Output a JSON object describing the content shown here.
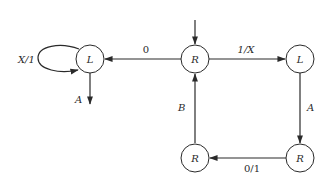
{
  "diagram": {
    "type": "state-machine",
    "nodes": [
      {
        "id": "n_left",
        "label": "L",
        "cx": 90,
        "cy": 59
      },
      {
        "id": "n_center",
        "label": "R",
        "cx": 195,
        "cy": 59
      },
      {
        "id": "n_right",
        "label": "L",
        "cx": 300,
        "cy": 59
      },
      {
        "id": "n_br",
        "label": "R",
        "cx": 300,
        "cy": 158
      },
      {
        "id": "n_bl",
        "label": "R",
        "cx": 195,
        "cy": 158
      }
    ],
    "edges": [
      {
        "from": "start",
        "to": "n_center",
        "label": ""
      },
      {
        "from": "n_center",
        "to": "n_left",
        "label": "0"
      },
      {
        "from": "n_center",
        "to": "n_right",
        "label": "1/X"
      },
      {
        "from": "n_left",
        "to": "n_left",
        "label": "X/1"
      },
      {
        "from": "n_left",
        "to": "halt",
        "label": "A"
      },
      {
        "from": "n_right",
        "to": "n_br",
        "label": "A"
      },
      {
        "from": "n_br",
        "to": "n_bl",
        "label": "0/1"
      },
      {
        "from": "n_bl",
        "to": "n_center",
        "label": "B"
      }
    ],
    "labels": {
      "left_state": "L",
      "center_state": "R",
      "right_state": "L",
      "bottom_right_state": "R",
      "bottom_left_state": "R",
      "edge_center_left": "0",
      "edge_center_right": "1/X",
      "edge_self_loop": "X/1",
      "edge_left_down": "A",
      "edge_right_down": "A",
      "edge_bottom": "0/1",
      "edge_up": "B"
    }
  }
}
